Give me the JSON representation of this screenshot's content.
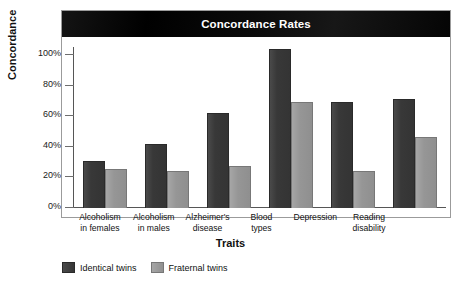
{
  "chart_data": {
    "type": "bar",
    "title": "Concordance Rates",
    "xlabel": "Traits",
    "ylabel": "Concordance",
    "ylim": [
      0,
      100
    ],
    "yticks": [
      "0%",
      "20%",
      "40%",
      "60%",
      "80%",
      "100%"
    ],
    "ytick_values": [
      0,
      20,
      40,
      60,
      80,
      100
    ],
    "grid": false,
    "legend_position": "bottom-left",
    "categories": [
      "Alcoholism in females",
      "Alcoholism in males",
      "Alzheimer's disease",
      "Blood types",
      "Depression",
      "Reading disability"
    ],
    "category_lines": [
      [
        "Alcoholism",
        "in females"
      ],
      [
        "Alcoholism",
        "in males"
      ],
      [
        "Alzheimer's",
        "disease"
      ],
      [
        "Blood",
        "types"
      ],
      [
        "Depression",
        ""
      ],
      [
        "Reading",
        "disability"
      ]
    ],
    "series": [
      {
        "name": "Identical twins",
        "color": "#3d3d3d",
        "values": [
          29,
          40,
          59,
          99,
          66,
          68
        ]
      },
      {
        "name": "Fraternal twins",
        "color": "#9a9a9a",
        "values": [
          24,
          23,
          26,
          66,
          23,
          44
        ]
      }
    ]
  },
  "chart": {
    "title": "Concordance Rates",
    "y_axis_title": "Concordance",
    "x_axis_title": "Traits",
    "title_bar_color": "#0d0d0d",
    "title_text_color": "#ffffff",
    "frame_color": "#9b9b9b"
  },
  "legend": {
    "items": [
      {
        "label": "Identical twins",
        "color": "#3d3d3d"
      },
      {
        "label": "Fraternal twins",
        "color": "#9a9a9a"
      }
    ]
  }
}
